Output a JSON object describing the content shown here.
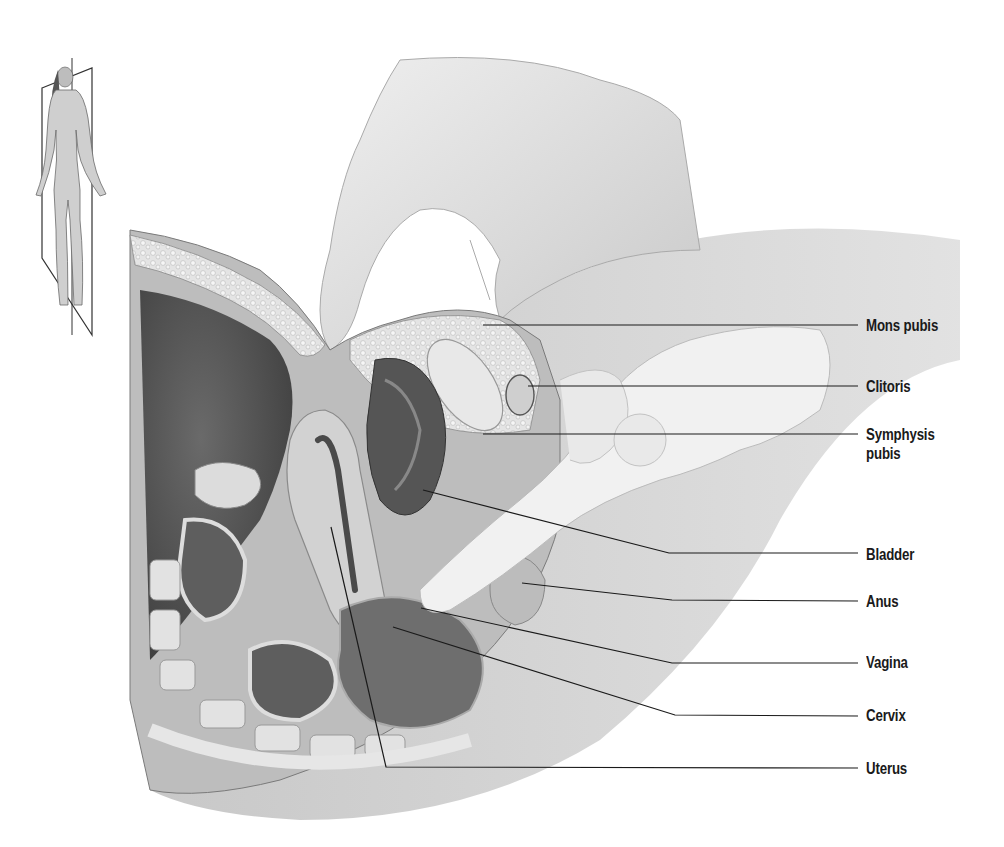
{
  "diagram": {
    "type": "anatomical-illustration",
    "orientation_figure": {
      "description": "Standing female figure with sagittal plane indicator"
    },
    "colors": {
      "background": "#ffffff",
      "leader_line": "#1a1a1a",
      "label_text": "#1a1a1a",
      "tissue_light": "#d9d9d9",
      "tissue_mid": "#9a9a9a",
      "tissue_dark": "#4a4a4a"
    },
    "labels": [
      {
        "id": "mons-pubis",
        "text": "Mons pubis",
        "y": 325
      },
      {
        "id": "clitoris",
        "text": "Clitoris",
        "y": 386
      },
      {
        "id": "symphysis-pubis",
        "text": "Symphysis pubis",
        "lines": [
          "Symphysis",
          "pubis"
        ],
        "y": 434
      },
      {
        "id": "bladder",
        "text": "Bladder",
        "y": 554
      },
      {
        "id": "anus",
        "text": "Anus",
        "y": 601
      },
      {
        "id": "vagina",
        "text": "Vagina",
        "y": 662
      },
      {
        "id": "cervix",
        "text": "Cervix",
        "y": 715
      },
      {
        "id": "uterus",
        "text": "Uterus",
        "y": 768
      }
    ]
  }
}
